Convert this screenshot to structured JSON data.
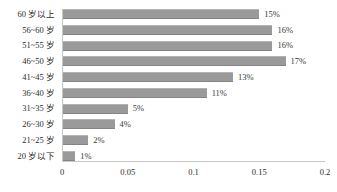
{
  "chart_data": {
    "type": "bar",
    "orientation": "horizontal",
    "title": "",
    "xlabel": "",
    "ylabel": "",
    "xlim": [
      0,
      0.2
    ],
    "xticks": [
      "0",
      "0.05",
      "0.1",
      "0.15",
      "0.2"
    ],
    "xtick_values": [
      0,
      0.05,
      0.1,
      0.15,
      0.2
    ],
    "grid": false,
    "legend": null,
    "bar_color": "#9a9a9a",
    "categories": [
      "60 岁以上",
      "56~60 岁",
      "51~55 岁",
      "46~50 岁",
      "41~45 岁",
      "36~40 岁",
      "31~35 岁",
      "26~30 岁",
      "21~25 岁",
      "20 岁以下"
    ],
    "values": [
      0.15,
      0.16,
      0.16,
      0.17,
      0.13,
      0.11,
      0.05,
      0.04,
      0.02,
      0.01
    ],
    "data_labels": [
      "15%",
      "16%",
      "16%",
      "17%",
      "13%",
      "11%",
      "5%",
      "4%",
      "2%",
      "1%"
    ]
  }
}
